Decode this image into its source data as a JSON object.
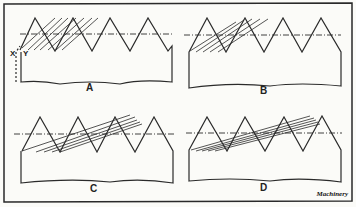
{
  "figure": {
    "panels": [
      {
        "id": "A",
        "label": "A"
      },
      {
        "id": "B",
        "label": "B"
      },
      {
        "id": "C",
        "label": "C"
      },
      {
        "id": "D",
        "label": "D"
      }
    ],
    "markers": {
      "x": "X",
      "y": "Y"
    },
    "credit": "Machinery"
  }
}
